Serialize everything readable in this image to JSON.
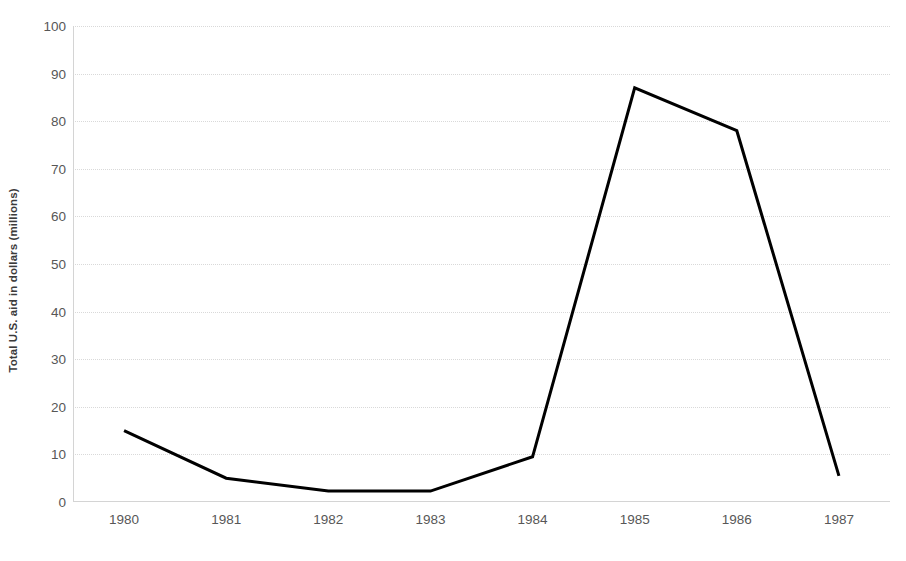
{
  "chart_data": {
    "type": "line",
    "title": "",
    "xlabel": "",
    "ylabel": "Total U.S. aid in dollars (millions)",
    "categories": [
      "1980",
      "1981",
      "1982",
      "1983",
      "1984",
      "1985",
      "1986",
      "1987"
    ],
    "values": [
      15,
      5,
      2.3,
      2.3,
      9.5,
      87,
      78,
      5.5
    ],
    "series": [
      {
        "name": "Total U.S. aid",
        "values": [
          15,
          5,
          2.3,
          2.3,
          9.5,
          87,
          78,
          5.5
        ],
        "color": "#000000"
      }
    ],
    "ylim": [
      0,
      100
    ],
    "ytick_labels": [
      "0",
      "10",
      "20",
      "30",
      "40",
      "50",
      "60",
      "70",
      "80",
      "90",
      "100"
    ],
    "ytick_values": [
      0,
      10,
      20,
      30,
      40,
      50,
      60,
      70,
      80,
      90,
      100
    ],
    "grid": true,
    "grid_axis": "y",
    "grid_color": "#d9d9d9",
    "legend": false,
    "legend_position": "none",
    "axis_color": "#d4d4d4",
    "tick_label_color": "#575757",
    "axis_title_color": "#3b3b3b",
    "line_width": 3,
    "background": "#ffffff"
  }
}
